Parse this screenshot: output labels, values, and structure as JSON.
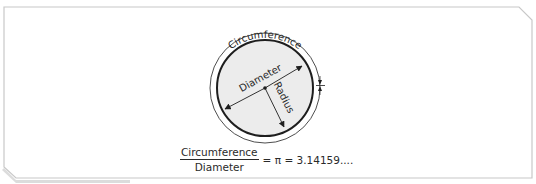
{
  "diagram": {
    "labels": {
      "circumference": "Circumference",
      "diameter": "Diameter",
      "radius": "Radius"
    },
    "formula": {
      "numerator": "Circumference",
      "denominator": "Diameter",
      "result": "= π = 3.14159...."
    },
    "colors": {
      "frame": "#c8c8c8",
      "frame_shadow": "#d9d9d9",
      "inner_fill": "#ececec",
      "stroke": "#1e1e1e",
      "outer_stroke": "#3a3a3a"
    }
  }
}
